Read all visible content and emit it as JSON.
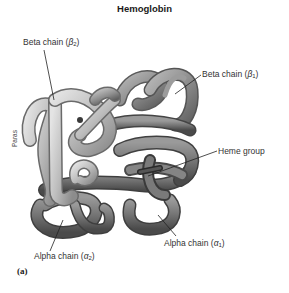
{
  "figure": {
    "title": "Hemoglobin",
    "panel_label": "(a)",
    "credit": "Paras",
    "labels": {
      "beta2": {
        "text": "Beta chain (",
        "symbol": "β",
        "subscript": "2",
        "close": ")"
      },
      "beta1": {
        "text": "Beta chain (",
        "symbol": "β",
        "subscript": "1",
        "close": ")"
      },
      "heme": {
        "text": "Heme group"
      },
      "alpha2": {
        "text": "Alpha chain (",
        "symbol": "α",
        "subscript": "2",
        "close": ")"
      },
      "alpha1": {
        "text": "Alpha chain (",
        "symbol": "α",
        "subscript": "1",
        "close": ")"
      }
    },
    "colors": {
      "beta_chain_light": "#c9c9c9",
      "beta_chain_mid": "#a6a6a6",
      "alpha_chain_dark": "#6e6e6e",
      "alpha_chain_mid": "#8a8a8a",
      "leader_line": "#222222",
      "background": "#ffffff"
    }
  }
}
